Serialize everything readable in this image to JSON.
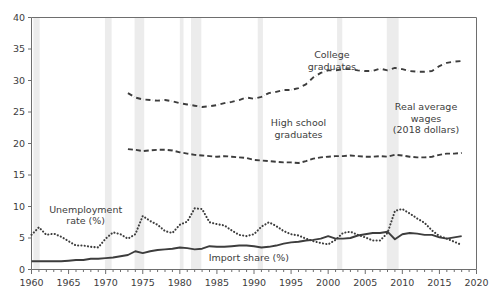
{
  "chart_data": {
    "type": "line",
    "title": "",
    "subtitle": "",
    "xlabel": "",
    "ylabel": "",
    "xlim": [
      1960,
      2020
    ],
    "ylim": [
      0,
      40
    ],
    "grid": false,
    "legend_position": "inline-annotations",
    "x_major_step": 5,
    "x_minor_step": 1,
    "y_major_step": 5,
    "x_ticks": [
      "1960",
      "1965",
      "1970",
      "1975",
      "1980",
      "1985",
      "1990",
      "1995",
      "2000",
      "2005",
      "2010",
      "2015",
      "2020"
    ],
    "y_ticks": [
      "0",
      "5",
      "10",
      "15",
      "20",
      "25",
      "30",
      "35",
      "40"
    ],
    "annotations": [
      {
        "name": "college-graduates-label",
        "text": "College\ngraduates",
        "lines": [
          "College",
          "graduates"
        ],
        "x": 2000.5,
        "y": 33.5
      },
      {
        "name": "high-school-graduates-label",
        "text": "High school\ngraduates",
        "lines": [
          "High school",
          "graduates"
        ],
        "x": 1996.0,
        "y": 22.7
      },
      {
        "name": "real-average-wages-label",
        "text": "Real average wages (2018 dollars)",
        "lines": [
          "Real average",
          "wages",
          "(2018 dollars)"
        ],
        "x": 2013.2,
        "y": 25.3
      },
      {
        "name": "unemployment-rate-label",
        "text": "Unemployment rate (%)",
        "lines": [
          "Unemployment",
          "rate (%)"
        ],
        "x": 1967.3,
        "y": 9.0
      },
      {
        "name": "import-share-label",
        "text": "Import share (%)",
        "lines": [
          "Import share (%)"
        ],
        "x": 1989.3,
        "y": 1.35
      }
    ],
    "recessions": [
      {
        "name": "recession-1960-1961",
        "start": 1960.25,
        "end": 1961.1
      },
      {
        "name": "recession-1969-1970",
        "start": 1969.9,
        "end": 1970.8
      },
      {
        "name": "recession-1973-1975",
        "start": 1973.9,
        "end": 1975.2
      },
      {
        "name": "recession-1980",
        "start": 1980.0,
        "end": 1980.5
      },
      {
        "name": "recession-1981-1982",
        "start": 1981.5,
        "end": 1982.9
      },
      {
        "name": "recession-1990-1991",
        "start": 1990.5,
        "end": 1991.2
      },
      {
        "name": "recession-2001",
        "start": 2001.2,
        "end": 2001.9
      },
      {
        "name": "recession-2007-2009",
        "start": 2007.9,
        "end": 2009.5
      }
    ],
    "recession_color": "#ececec",
    "series": [
      {
        "name": "College graduates",
        "style": "dash-dot",
        "color": "#3d3d3d",
        "unit": "dollars per hour (2018 dollars)",
        "x": [
          1973,
          1974,
          1975,
          1976,
          1977,
          1978,
          1979,
          1980,
          1981,
          1982,
          1983,
          1984,
          1985,
          1986,
          1987,
          1988,
          1989,
          1990,
          1991,
          1992,
          1993,
          1994,
          1995,
          1996,
          1997,
          1998,
          1999,
          2000,
          2001,
          2002,
          2003,
          2004,
          2005,
          2006,
          2007,
          2008,
          2009,
          2010,
          2011,
          2012,
          2013,
          2014,
          2015,
          2016,
          2017,
          2018
        ],
        "values": [
          28.0,
          27.3,
          27.0,
          26.9,
          26.8,
          26.9,
          26.7,
          26.4,
          26.2,
          26.0,
          25.8,
          25.9,
          26.1,
          26.4,
          26.6,
          26.9,
          27.3,
          27.1,
          27.4,
          28.0,
          28.2,
          28.5,
          28.5,
          28.8,
          29.4,
          30.5,
          31.2,
          31.6,
          31.6,
          31.8,
          31.8,
          31.6,
          31.5,
          31.5,
          31.9,
          31.6,
          32.0,
          31.8,
          31.5,
          31.4,
          31.4,
          31.5,
          32.3,
          32.8,
          33.0,
          33.1
        ]
      },
      {
        "name": "High school graduates",
        "style": "dashed",
        "color": "#3d3d3d",
        "unit": "dollars per hour (2018 dollars)",
        "x": [
          1973,
          1974,
          1975,
          1976,
          1977,
          1978,
          1979,
          1980,
          1981,
          1982,
          1983,
          1984,
          1985,
          1986,
          1987,
          1988,
          1989,
          1990,
          1991,
          1992,
          1993,
          1994,
          1995,
          1996,
          1997,
          1998,
          1999,
          2000,
          2001,
          2002,
          2003,
          2004,
          2005,
          2006,
          2007,
          2008,
          2009,
          2010,
          2011,
          2012,
          2013,
          2014,
          2015,
          2016,
          2017,
          2018
        ],
        "values": [
          19.1,
          19.0,
          18.8,
          18.9,
          19.0,
          19.0,
          18.9,
          18.6,
          18.4,
          18.2,
          18.1,
          18.0,
          17.9,
          18.0,
          17.9,
          17.8,
          17.7,
          17.4,
          17.3,
          17.2,
          17.1,
          17.0,
          17.0,
          16.9,
          17.2,
          17.6,
          17.8,
          17.9,
          18.0,
          18.0,
          18.1,
          18.0,
          17.9,
          17.9,
          18.0,
          17.9,
          18.2,
          18.1,
          17.9,
          17.8,
          17.8,
          17.9,
          18.2,
          18.4,
          18.4,
          18.5
        ]
      },
      {
        "name": "Unemployment rate (%)",
        "style": "dotted",
        "color": "#3d3d3d",
        "unit": "percent",
        "x": [
          1960,
          1961,
          1962,
          1963,
          1964,
          1965,
          1966,
          1967,
          1968,
          1969,
          1970,
          1971,
          1972,
          1973,
          1974,
          1975,
          1976,
          1977,
          1978,
          1979,
          1980,
          1981,
          1982,
          1983,
          1984,
          1985,
          1986,
          1987,
          1988,
          1989,
          1990,
          1991,
          1992,
          1993,
          1994,
          1995,
          1996,
          1997,
          1998,
          1999,
          2000,
          2001,
          2002,
          2003,
          2004,
          2005,
          2006,
          2007,
          2008,
          2009,
          2010,
          2011,
          2012,
          2013,
          2014,
          2015,
          2016,
          2017,
          2018
        ],
        "values": [
          5.5,
          6.7,
          5.5,
          5.7,
          5.2,
          4.5,
          3.8,
          3.8,
          3.6,
          3.5,
          4.9,
          5.9,
          5.6,
          4.9,
          5.6,
          8.5,
          7.7,
          7.1,
          6.1,
          5.8,
          7.1,
          7.6,
          9.7,
          9.6,
          7.5,
          7.2,
          7.0,
          6.2,
          5.5,
          5.3,
          5.6,
          6.8,
          7.5,
          6.9,
          6.1,
          5.6,
          5.4,
          4.9,
          4.5,
          4.2,
          4.0,
          4.7,
          5.8,
          6.0,
          5.5,
          5.1,
          4.6,
          4.6,
          5.8,
          9.3,
          9.6,
          8.9,
          8.1,
          7.4,
          6.2,
          5.3,
          4.9,
          4.4,
          3.9
        ]
      },
      {
        "name": "Import share (%)",
        "style": "solid",
        "color": "#3d3d3d",
        "unit": "percent of GDP",
        "x": [
          1960,
          1961,
          1962,
          1963,
          1964,
          1965,
          1966,
          1967,
          1968,
          1969,
          1970,
          1971,
          1972,
          1973,
          1974,
          1975,
          1976,
          1977,
          1978,
          1979,
          1980,
          1981,
          1982,
          1983,
          1984,
          1985,
          1986,
          1987,
          1988,
          1989,
          1990,
          1991,
          1992,
          1993,
          1994,
          1995,
          1996,
          1997,
          1998,
          1999,
          2000,
          2001,
          2002,
          2003,
          2004,
          2005,
          2006,
          2007,
          2008,
          2009,
          2010,
          2011,
          2012,
          2013,
          2014,
          2015,
          2016,
          2017,
          2018
        ],
        "values": [
          1.3,
          1.3,
          1.3,
          1.3,
          1.3,
          1.4,
          1.5,
          1.5,
          1.7,
          1.7,
          1.8,
          1.9,
          2.1,
          2.3,
          2.9,
          2.6,
          2.9,
          3.1,
          3.2,
          3.3,
          3.5,
          3.4,
          3.2,
          3.3,
          3.7,
          3.6,
          3.6,
          3.7,
          3.8,
          3.8,
          3.7,
          3.5,
          3.6,
          3.8,
          4.1,
          4.3,
          4.4,
          4.6,
          4.7,
          4.9,
          5.3,
          4.9,
          4.9,
          5.0,
          5.4,
          5.6,
          5.8,
          5.8,
          6.0,
          4.8,
          5.6,
          5.8,
          5.7,
          5.5,
          5.5,
          5.1,
          4.9,
          5.1,
          5.3
        ]
      }
    ]
  },
  "axes": {
    "y_tick_labels": [
      "40",
      "35",
      "30",
      "25",
      "20",
      "15",
      "10",
      "5",
      "0"
    ],
    "x_tick_labels": [
      "1960",
      "1965",
      "1970",
      "1975",
      "1980",
      "1985",
      "1990",
      "1995",
      "2000",
      "2005",
      "2010",
      "2015",
      "2020"
    ]
  }
}
